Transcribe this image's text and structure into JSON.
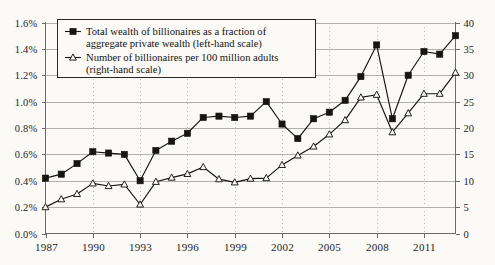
{
  "chart_data": {
    "type": "line",
    "title": "",
    "subtitle": "",
    "xlabel": "",
    "ylabel": "",
    "grid": true,
    "legend_position": "top-left-inside",
    "x": [
      1987,
      1988,
      1989,
      1990,
      1991,
      1992,
      1993,
      1994,
      1995,
      1996,
      1997,
      1998,
      1999,
      2000,
      2001,
      2002,
      2003,
      2004,
      2005,
      2006,
      2007,
      2008,
      2009,
      2010,
      2011,
      2012,
      2013
    ],
    "x_tick_labels": [
      "1987",
      "1990",
      "1993",
      "1996",
      "1999",
      "2002",
      "2005",
      "2008",
      "2011"
    ],
    "x_tick_values": [
      1987,
      1990,
      1993,
      1996,
      1999,
      2002,
      2005,
      2008,
      2011
    ],
    "xlim": [
      1987,
      2013
    ],
    "left_axis": {
      "label": "",
      "ylim": [
        0.0,
        1.6
      ],
      "tick_labels": [
        "0.0%",
        "0.2%",
        "0.4%",
        "0.6%",
        "0.8%",
        "1.0%",
        "1.2%",
        "1.4%",
        "1.6%"
      ],
      "tick_values": [
        0.0,
        0.2,
        0.4,
        0.6,
        0.8,
        1.0,
        1.2,
        1.4,
        1.6
      ]
    },
    "right_axis": {
      "label": "",
      "ylim": [
        0,
        40
      ],
      "tick_labels": [
        "0",
        "5",
        "10",
        "15",
        "20",
        "25",
        "30",
        "35",
        "40"
      ],
      "tick_values": [
        0,
        5,
        10,
        15,
        20,
        25,
        30,
        35,
        40
      ]
    },
    "series": [
      {
        "name": "Total wealth of billionaires as a fraction of aggregate private wealth (left-hand scale)",
        "axis": "left",
        "marker": "filled-square",
        "color": "#16150f",
        "values": [
          0.42,
          0.45,
          0.53,
          0.62,
          0.61,
          0.6,
          0.4,
          0.63,
          0.7,
          0.76,
          0.88,
          0.89,
          0.88,
          0.89,
          1.0,
          0.83,
          0.72,
          0.87,
          0.92,
          1.01,
          1.19,
          1.43,
          0.87,
          1.2,
          1.38,
          1.36,
          1.5
        ]
      },
      {
        "name": "Number of billionaires per 100 million adults (right-hand scale)",
        "axis": "right",
        "marker": "open-triangle",
        "color": "#16150f",
        "values": [
          5.0,
          6.5,
          7.5,
          9.5,
          9.0,
          9.3,
          5.5,
          9.8,
          10.6,
          11.3,
          12.6,
          10.3,
          9.7,
          10.4,
          10.5,
          13.0,
          14.8,
          16.5,
          18.8,
          21.5,
          25.8,
          26.3,
          19.2,
          22.8,
          26.5,
          26.5,
          30.5
        ]
      }
    ]
  },
  "legend": {
    "entries": [
      {
        "marker": "filled-square",
        "line1": "Total wealth of billionaires as a fraction of",
        "line2": "aggregate private wealth (left-hand scale)"
      },
      {
        "marker": "open-triangle",
        "line1": "Number of billionaires per 100 million adults",
        "line2": "(right-hand scale)"
      }
    ]
  }
}
